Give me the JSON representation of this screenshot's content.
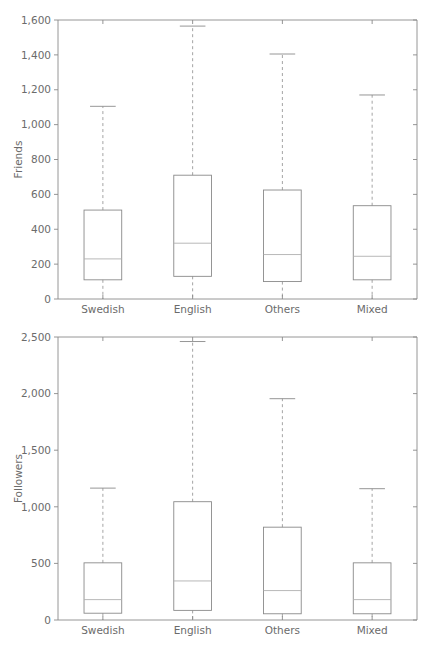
{
  "figure": {
    "width": 430,
    "height": 648,
    "background": "#ffffff",
    "line_color": "#8a8a8a",
    "text_color": "#6b6b6b",
    "median_color": "#b0b0b0"
  },
  "chart_data": [
    {
      "type": "box",
      "id": "friends",
      "title": "",
      "xlabel": "",
      "ylabel": "Friends",
      "categories": [
        "Swedish",
        "English",
        "Others",
        "Mixed"
      ],
      "ylim": [
        0,
        1600
      ],
      "yticks": [
        0,
        200,
        400,
        600,
        800,
        1000,
        1200,
        1400,
        1600
      ],
      "ytick_labels": [
        "0",
        "200",
        "400",
        "600",
        "800",
        "1,000",
        "1,200",
        "1,400",
        "1,600"
      ],
      "grid": false,
      "legend": null,
      "boxes": [
        {
          "category": "Swedish",
          "whisker_low": 0,
          "q1": 110,
          "median": 230,
          "q3": 510,
          "whisker_high": 1105
        },
        {
          "category": "English",
          "whisker_low": 0,
          "q1": 130,
          "median": 320,
          "q3": 710,
          "whisker_high": 1565
        },
        {
          "category": "Others",
          "whisker_low": 0,
          "q1": 100,
          "median": 255,
          "q3": 625,
          "whisker_high": 1405
        },
        {
          "category": "Mixed",
          "whisker_low": 0,
          "q1": 110,
          "median": 245,
          "q3": 535,
          "whisker_high": 1170
        }
      ]
    },
    {
      "type": "box",
      "id": "followers",
      "title": "",
      "xlabel": "",
      "ylabel": "Followers",
      "categories": [
        "Swedish",
        "English",
        "Others",
        "Mixed"
      ],
      "ylim": [
        0,
        2500
      ],
      "yticks": [
        0,
        500,
        1000,
        1500,
        2000,
        2500
      ],
      "ytick_labels": [
        "0",
        "500",
        "1,000",
        "1,500",
        "2,000",
        "2,500"
      ],
      "grid": false,
      "legend": null,
      "boxes": [
        {
          "category": "Swedish",
          "whisker_low": 0,
          "q1": 60,
          "median": 180,
          "q3": 505,
          "whisker_high": 1165
        },
        {
          "category": "English",
          "whisker_low": 0,
          "q1": 85,
          "median": 345,
          "q3": 1045,
          "whisker_high": 2460
        },
        {
          "category": "Others",
          "whisker_low": 0,
          "q1": 55,
          "median": 260,
          "q3": 820,
          "whisker_high": 1955
        },
        {
          "category": "Mixed",
          "whisker_low": 0,
          "q1": 55,
          "median": 180,
          "q3": 505,
          "whisker_high": 1160
        }
      ]
    }
  ]
}
